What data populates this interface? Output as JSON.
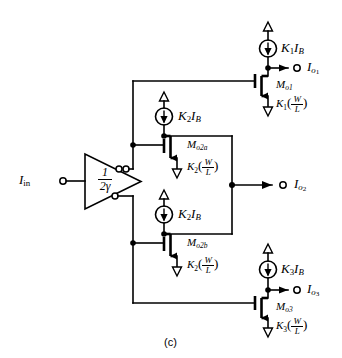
{
  "figure": {
    "caption": "(c)",
    "input_label": "I",
    "input_sub": "in"
  },
  "amplifier": {
    "name": "inverting-amplifier",
    "gain_numerator": "1",
    "gain_denominator": "2γ"
  },
  "branches": [
    {
      "id": "top",
      "source_label": "K",
      "source_sub": "1",
      "source_rest": "I",
      "source_rest_sub": "B",
      "output_label": "I",
      "output_sub": "o",
      "output_subsub": "1",
      "device_label": "M",
      "device_sub": "o1",
      "ratio_coeff": "K",
      "ratio_coeff_sub": "1",
      "ratio_num": "W",
      "ratio_den": "L"
    },
    {
      "id": "mid-upper",
      "source_label": "K",
      "source_sub": "2",
      "source_rest": "I",
      "source_rest_sub": "B",
      "device_label": "M",
      "device_sub": "o2a",
      "ratio_coeff": "K",
      "ratio_coeff_sub": "2",
      "ratio_num": "W",
      "ratio_den": "L"
    },
    {
      "id": "mid-lower",
      "source_label": "K",
      "source_sub": "2",
      "source_rest": "I",
      "source_rest_sub": "B",
      "device_label": "M",
      "device_sub": "o2b",
      "ratio_coeff": "K",
      "ratio_coeff_sub": "2",
      "ratio_num": "W",
      "ratio_den": "L"
    },
    {
      "id": "bottom",
      "source_label": "K",
      "source_sub": "3",
      "source_rest": "I",
      "source_rest_sub": "B",
      "output_label": "I",
      "output_sub": "o",
      "output_subsub": "3",
      "device_label": "M",
      "device_sub": "o3",
      "ratio_coeff": "K",
      "ratio_coeff_sub": "3",
      "ratio_num": "W",
      "ratio_den": "L"
    }
  ],
  "outputs": {
    "io2_label": "I",
    "io2_sub": "o",
    "io2_subsub": "2"
  },
  "colors": {
    "ink": "#000000",
    "paper": "#ffffff"
  }
}
